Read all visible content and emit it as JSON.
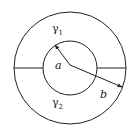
{
  "diagram": {
    "type": "concentric-circles",
    "outer_circle": {
      "cx": 70,
      "cy": 68,
      "r": 56
    },
    "inner_circle": {
      "cx": 70,
      "cy": 68,
      "r": 27
    },
    "regions": [
      {
        "name": "upper",
        "label": "γ",
        "subscript": "1"
      },
      {
        "name": "lower",
        "label": "γ",
        "subscript": "2"
      }
    ],
    "radius_labels": {
      "inner": "a",
      "outer": "b"
    },
    "colors": {
      "stroke": "#222222",
      "background": "#ffffff"
    }
  }
}
